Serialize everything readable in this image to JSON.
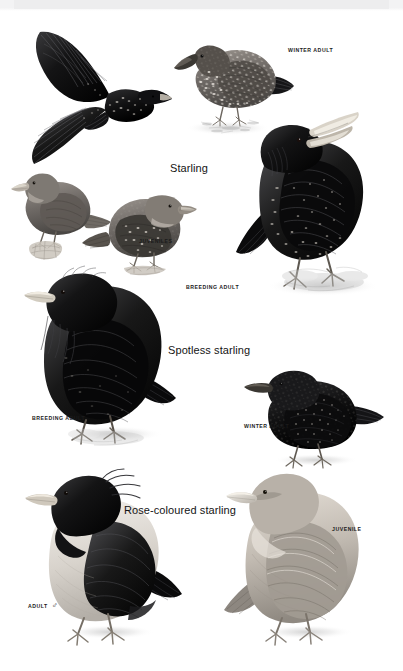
{
  "plate": {
    "kind": "field-guide-illustration-plate",
    "background_color": "#ffffff",
    "top_band_color": "#ededee",
    "ink_color": "#1b1b1b",
    "style": "monochrome greyscale bird plate"
  },
  "species_headings": [
    {
      "id": "starling",
      "label": "Starling",
      "x": 170,
      "y": 163
    },
    {
      "id": "spotless-starling",
      "label": "Spotless starling",
      "x": 168,
      "y": 345
    },
    {
      "id": "rose-coloured-starling",
      "label": "Rose-coloured starling",
      "x": 124,
      "y": 505
    }
  ],
  "figure_labels": [
    {
      "id": "starling-winter-adult",
      "label": "WINTER ADULT",
      "x": 288,
      "y": 48
    },
    {
      "id": "starling-juveniles",
      "label": "JUVENILES",
      "x": 139,
      "y": 239
    },
    {
      "id": "starling-breeding-adult",
      "label": "BREEDING ADULT",
      "x": 186,
      "y": 285
    },
    {
      "id": "spotless-breeding-adult",
      "label": "BREEDING ADULT",
      "x": 32,
      "y": 416
    },
    {
      "id": "spotless-winter-adult",
      "label": "WINTER ADULT",
      "x": 244,
      "y": 424
    },
    {
      "id": "rose-juvenile",
      "label": "JUVENILE",
      "x": 332,
      "y": 527
    },
    {
      "id": "rose-adult-male",
      "label": "ADULT",
      "x": 28,
      "y": 602,
      "symbol": "♂"
    }
  ],
  "figures": [
    {
      "id": "starling-flight",
      "name": "starling-in-flight",
      "species": "Starling",
      "plumage": "adult in flight, upperwing"
    },
    {
      "id": "starling-winter",
      "name": "starling-winter-adult",
      "species": "Starling",
      "plumage": "winter adult, heavily spotted, feeding on ground"
    },
    {
      "id": "starling-breeding",
      "name": "starling-breeding-adult",
      "species": "Starling",
      "plumage": "breeding adult, glossy black, singing with bill open, yellow bill"
    },
    {
      "id": "starling-juv-left",
      "name": "starling-juvenile-perched",
      "species": "Starling",
      "plumage": "juvenile, plain greyish-brown, perched on stump"
    },
    {
      "id": "starling-juv-right",
      "name": "starling-juvenile-moulting",
      "species": "Starling",
      "plumage": "juvenile moulting to first-winter, spotted body, brown head"
    },
    {
      "id": "spotless-breeding",
      "name": "spotless-starling-breeding-adult",
      "species": "Spotless starling",
      "plumage": "breeding adult, long throat hackles, unspotted black"
    },
    {
      "id": "spotless-winter",
      "name": "spotless-starling-winter-adult",
      "species": "Spotless starling",
      "plumage": "winter adult, fine pale spotting"
    },
    {
      "id": "rose-adult",
      "name": "rose-coloured-starling-adult-male",
      "species": "Rose-coloured starling",
      "plumage": "adult male, black hood crest and wings, pale pink body"
    },
    {
      "id": "rose-juvenile",
      "name": "rose-coloured-starling-juvenile",
      "species": "Rose-coloured starling",
      "plumage": "juvenile, sandy-buff, pale stubby bill"
    }
  ]
}
